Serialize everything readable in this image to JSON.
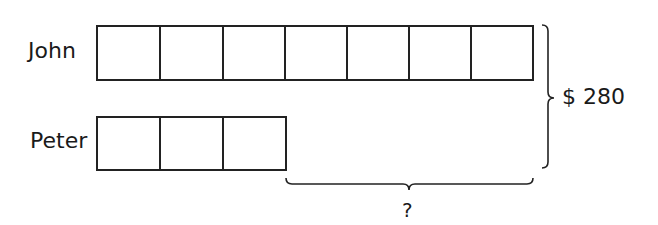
{
  "diagram": {
    "type": "bar-model",
    "rows": [
      {
        "name": "John",
        "units": 7
      },
      {
        "name": "Peter",
        "units": 3
      }
    ],
    "total_label": "$ 280",
    "difference_label": "?"
  }
}
